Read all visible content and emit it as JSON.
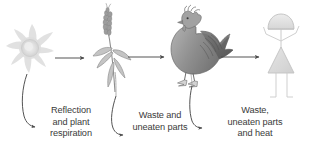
{
  "diagram": {
    "width": 310,
    "height": 154,
    "background_color": "#ffffff",
    "text_color": "#3a3a3a",
    "arrow_color": "#4a4a4a",
    "organism_outline_color": "#9a9a9a"
  },
  "stages": [
    {
      "id": "sun",
      "icon": "sun-swirl-icon",
      "label": "",
      "fill_color": "#e3e3e3",
      "center_x": 30,
      "center_y": 48
    },
    {
      "id": "plant",
      "icon": "wheat-plant-icon",
      "label": "",
      "fill_color": "#a8a8a8",
      "center_x": 113,
      "center_y": 50
    },
    {
      "id": "chicken",
      "icon": "chicken-icon",
      "label": "",
      "fill_color": "#8e8e8e",
      "center_x": 190,
      "center_y": 48
    },
    {
      "id": "human",
      "icon": "stick-figure-person-icon",
      "label": "",
      "fill_color": "#d8d8d8",
      "center_x": 280,
      "center_y": 52
    }
  ],
  "transfer_arrows": [
    {
      "id": "sun-to-plant",
      "from": "sun",
      "to": "plant",
      "label": ""
    },
    {
      "id": "plant-to-chicken",
      "from": "plant",
      "to": "chicken",
      "label": ""
    },
    {
      "id": "chicken-to-human",
      "from": "chicken",
      "to": "human",
      "label": ""
    }
  ],
  "loss_labels": {
    "loss_1": {
      "lines": [
        "Reflection",
        "and plant",
        "respiration"
      ],
      "line_1": "Reflection",
      "line_2": "and plant",
      "line_3": "respiration"
    },
    "loss_2": {
      "lines": [
        "Waste and",
        "uneaten parts"
      ],
      "line_1": "Waste and",
      "line_2": "uneaten parts"
    },
    "loss_3": {
      "lines": [
        "Waste,",
        "uneaten parts",
        "and heat"
      ],
      "line_1": "Waste,",
      "line_2": "uneaten parts",
      "line_3": "and heat"
    }
  }
}
